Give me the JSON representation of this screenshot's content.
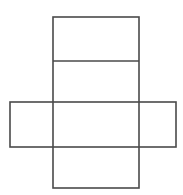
{
  "figure": {
    "name": "cube-net-diagram",
    "title": "Cube net diagram",
    "canvas": {
      "width": 183,
      "height": 195,
      "background_color": "#ffffff"
    },
    "style": {
      "stroke_color": "#4a4a4a",
      "stroke_width": 1.6,
      "fill_color": "none"
    },
    "shapes": [
      {
        "id": "vertical-strip",
        "label": "Vertical strip",
        "type": "rect",
        "x": 53,
        "y": 17,
        "width": 86,
        "height": 171
      },
      {
        "id": "horizontal-strip",
        "label": "Horizontal strip",
        "type": "rect",
        "x": 10,
        "y": 102,
        "width": 166,
        "height": 45
      }
    ],
    "dividers": [
      {
        "id": "top-divider",
        "label": "Top divider line",
        "type": "line",
        "x1": 53,
        "y1": 61,
        "x2": 139,
        "y2": 61
      }
    ],
    "cells": [
      {
        "id": "cell-top",
        "label": "Top face"
      },
      {
        "id": "cell-upper-middle",
        "label": "Upper middle face"
      },
      {
        "id": "cell-left",
        "label": "Left face"
      },
      {
        "id": "cell-center",
        "label": "Center face"
      },
      {
        "id": "cell-right",
        "label": "Right face"
      },
      {
        "id": "cell-bottom",
        "label": "Bottom face"
      }
    ]
  }
}
